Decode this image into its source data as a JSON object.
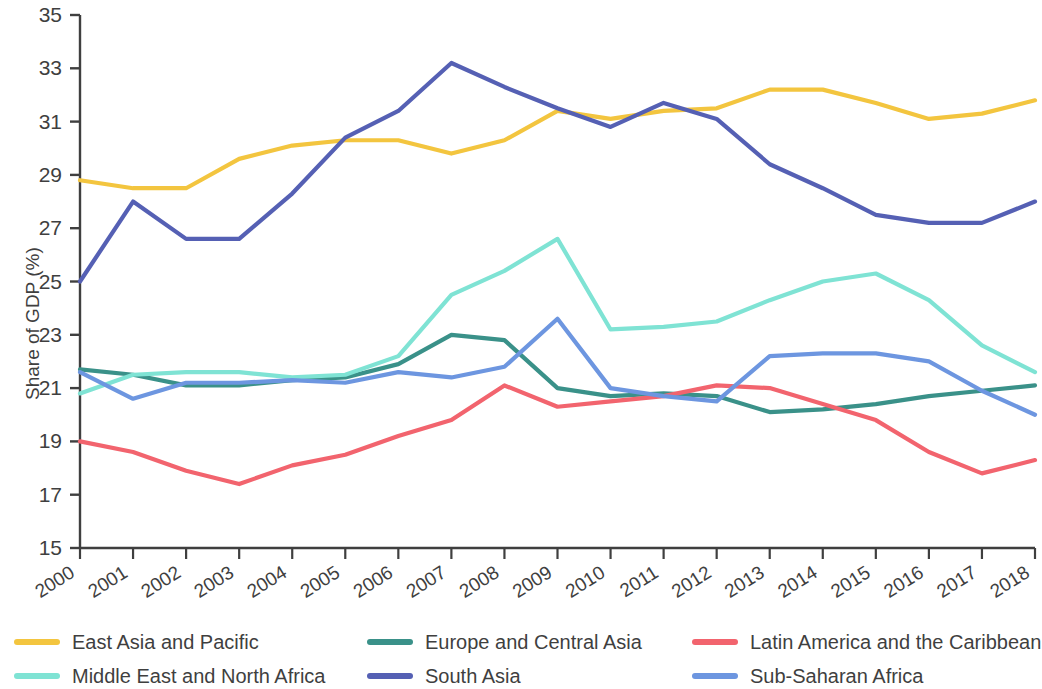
{
  "chart_data": {
    "type": "line",
    "title": "",
    "xlabel": "",
    "ylabel": "Share of GDP (%)",
    "xlim": [
      2000,
      2018
    ],
    "ylim": [
      15,
      35
    ],
    "yticks": [
      15,
      17,
      19,
      21,
      23,
      25,
      27,
      29,
      31,
      33,
      35
    ],
    "grid": false,
    "legend_position": "bottom",
    "categories": [
      "2000",
      "2001",
      "2002",
      "2003",
      "2004",
      "2005",
      "2006",
      "2007",
      "2008",
      "2009",
      "2010",
      "2011",
      "2012",
      "2013",
      "2014",
      "2015",
      "2016",
      "2017",
      "2018"
    ],
    "series": [
      {
        "name": "East Asia and Pacific",
        "color": "#f3c53f",
        "values": [
          28.8,
          28.5,
          28.5,
          29.6,
          30.1,
          30.3,
          30.3,
          29.8,
          30.3,
          31.4,
          31.1,
          31.4,
          31.5,
          32.2,
          32.2,
          31.7,
          31.1,
          31.3,
          31.8
        ]
      },
      {
        "name": "Europe and Central Asia",
        "color": "#3a9189",
        "values": [
          21.7,
          21.5,
          21.1,
          21.1,
          21.3,
          21.4,
          21.9,
          23.0,
          22.8,
          21.0,
          20.7,
          20.8,
          20.7,
          20.1,
          20.2,
          20.4,
          20.7,
          20.9,
          21.1
        ]
      },
      {
        "name": "Latin America and the Caribbean",
        "color": "#f2646e",
        "values": [
          19.0,
          18.6,
          17.9,
          17.4,
          18.1,
          18.5,
          19.2,
          19.8,
          21.1,
          20.3,
          20.5,
          20.7,
          21.1,
          21.0,
          20.4,
          19.8,
          18.6,
          17.8,
          18.3
        ]
      },
      {
        "name": "Middle East and North Africa",
        "color": "#7fe3d4",
        "values": [
          20.8,
          21.5,
          21.6,
          21.6,
          21.4,
          21.5,
          22.2,
          24.5,
          25.4,
          26.6,
          23.2,
          23.3,
          23.5,
          24.3,
          25.0,
          25.3,
          24.3,
          22.6,
          21.6
        ]
      },
      {
        "name": "South Asia",
        "color": "#5560b4",
        "values": [
          25.0,
          28.0,
          26.6,
          26.6,
          28.3,
          30.4,
          31.4,
          33.2,
          32.3,
          31.5,
          30.8,
          31.7,
          31.1,
          29.4,
          28.5,
          27.5,
          27.2,
          27.2,
          28.0
        ]
      },
      {
        "name": "Sub-Saharan Africa",
        "color": "#6d96e0",
        "values": [
          21.6,
          20.6,
          21.2,
          21.2,
          21.3,
          21.2,
          21.6,
          21.4,
          21.8,
          23.6,
          21.0,
          20.7,
          20.5,
          22.2,
          22.3,
          22.3,
          22.0,
          20.9,
          20.0
        ]
      }
    ]
  },
  "axis": {
    "y_title": "Share of GDP (%)"
  },
  "legend": {
    "items": [
      {
        "label": "East Asia and Pacific",
        "color": "#f3c53f"
      },
      {
        "label": "Europe and Central Asia",
        "color": "#3a9189"
      },
      {
        "label": "Latin America and the Caribbean",
        "color": "#f2646e"
      },
      {
        "label": "Middle East and North Africa",
        "color": "#7fe3d4"
      },
      {
        "label": "South Asia",
        "color": "#5560b4"
      },
      {
        "label": "Sub-Saharan Africa",
        "color": "#6d96e0"
      }
    ]
  }
}
